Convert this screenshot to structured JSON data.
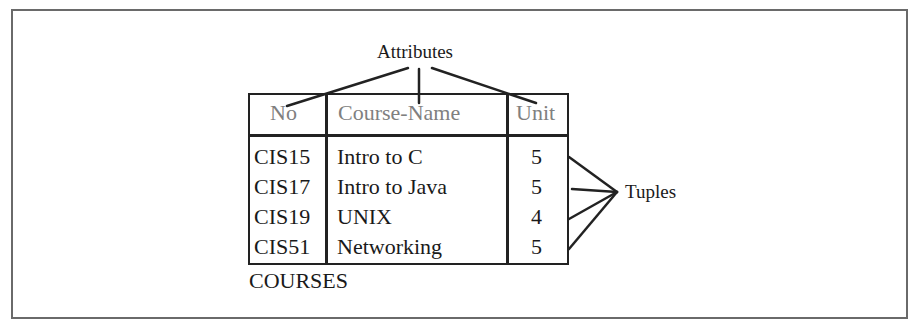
{
  "diagram": {
    "title_label": "Attributes",
    "tuples_label": "Tuples",
    "table_name": "COURSES",
    "columns": [
      "No",
      "Course-Name",
      "Unit"
    ],
    "rows": [
      {
        "no": "CIS15",
        "course_name": "Intro to C",
        "unit": "5"
      },
      {
        "no": "CIS17",
        "course_name": "Intro to Java",
        "unit": "5"
      },
      {
        "no": "CIS19",
        "course_name": "UNIX",
        "unit": "4"
      },
      {
        "no": "CIS51",
        "course_name": "Networking",
        "unit": "5"
      }
    ],
    "colors": {
      "header_text": "#808080",
      "body_text": "#1a1a1a",
      "border": "#222222",
      "frame": "#6a6a6a"
    }
  }
}
